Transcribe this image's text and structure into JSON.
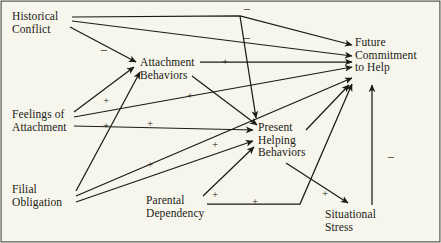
{
  "figure": {
    "type": "path-diagram",
    "background_color": "#f7f6ec",
    "ink_color": "#1b1b17",
    "border_color": "#4a4a40",
    "width": 441,
    "height": 243
  },
  "nodes": [
    {
      "id": "historical-conflict",
      "lines": [
        "Historical",
        "Conflict"
      ],
      "x": 12,
      "y": 10
    },
    {
      "id": "feelings-attachment",
      "lines": [
        "Feelings of",
        "Attachment"
      ],
      "x": 12,
      "y": 108
    },
    {
      "id": "filial-obligation",
      "lines": [
        "Filial",
        "Obligation"
      ],
      "x": 12,
      "y": 183
    },
    {
      "id": "parental-dependency",
      "lines": [
        "Parental",
        "Dependency"
      ],
      "x": 146,
      "y": 194
    },
    {
      "id": "attachment-behaviors",
      "lines": [
        "Attachment",
        "Behaviors"
      ],
      "x": 140,
      "y": 56
    },
    {
      "id": "present-helping",
      "lines": [
        "Present",
        "Helping",
        "Behaviors"
      ],
      "x": 258,
      "y": 121
    },
    {
      "id": "situational-stress",
      "lines": [
        "Situational",
        "Stress"
      ],
      "x": 325,
      "y": 208
    },
    {
      "id": "future-commitment",
      "lines": [
        "Future",
        "Commitment",
        "to Help"
      ],
      "x": 355,
      "y": 36
    }
  ],
  "edges": [
    {
      "id": "hc-to-fc",
      "from": "historical-conflict",
      "to": "future-commitment",
      "sign": "−",
      "sign_x": 243,
      "sign_y": 4,
      "routing": "elbow"
    },
    {
      "id": "hc-to-ph",
      "from": "historical-conflict",
      "to": "present-helping",
      "sign": "−",
      "sign_x": 243,
      "sign_y": 33,
      "routing": "elbow"
    },
    {
      "id": "hc-to-ab",
      "from": "historical-conflict",
      "to": "attachment-behaviors",
      "sign": "−",
      "sign_x": 100,
      "sign_y": 45,
      "routing": "straight"
    },
    {
      "id": "fa-to-ab",
      "from": "feelings-attachment",
      "to": "attachment-behaviors",
      "sign": "+",
      "sign_x": 103,
      "sign_y": 95,
      "routing": "straight"
    },
    {
      "id": "fa-to-fc",
      "from": "feelings-attachment",
      "to": "future-commitment",
      "sign": "+",
      "sign_x": 187,
      "sign_y": 90,
      "routing": "straight"
    },
    {
      "id": "fa-to-ph",
      "from": "feelings-attachment",
      "to": "present-helping",
      "sign": "+",
      "sign_x": 147,
      "sign_y": 118,
      "routing": "straight"
    },
    {
      "id": "fo-to-ab",
      "from": "filial-obligation",
      "to": "attachment-behaviors",
      "sign": "+",
      "sign_x": 103,
      "sign_y": 120,
      "routing": "straight"
    },
    {
      "id": "fo-to-fc",
      "from": "filial-obligation",
      "to": "future-commitment",
      "sign": "+",
      "sign_x": 147,
      "sign_y": 159,
      "routing": "straight"
    },
    {
      "id": "fo-to-ph",
      "from": "filial-obligation",
      "to": "present-helping",
      "sign": "+",
      "sign_x": 212,
      "sign_y": 139,
      "routing": "straight"
    },
    {
      "id": "ab-to-fc",
      "from": "attachment-behaviors",
      "to": "future-commitment",
      "sign": "+",
      "sign_x": 222,
      "sign_y": 56,
      "routing": "straight"
    },
    {
      "id": "ab-to-ph",
      "from": "attachment-behaviors",
      "to": "present-helping",
      "sign": "",
      "sign_x": 0,
      "sign_y": 0,
      "routing": "straight"
    },
    {
      "id": "pd-to-ph",
      "from": "parental-dependency",
      "to": "present-helping",
      "sign": "+",
      "sign_x": 212,
      "sign_y": 189,
      "routing": "straight"
    },
    {
      "id": "pd-to-fc",
      "from": "parental-dependency",
      "to": "future-commitment",
      "sign": "+",
      "sign_x": 252,
      "sign_y": 196,
      "routing": "elbow"
    },
    {
      "id": "ph-to-ss",
      "from": "present-helping",
      "to": "situational-stress",
      "sign": "+",
      "sign_x": 322,
      "sign_y": 188,
      "routing": "straight"
    },
    {
      "id": "ph-to-fc",
      "from": "present-helping",
      "to": "future-commitment",
      "sign": "",
      "sign_x": 0,
      "sign_y": 0,
      "routing": "straight"
    },
    {
      "id": "ss-to-fc",
      "from": "situational-stress",
      "to": "future-commitment",
      "sign": "−",
      "sign_x": 387,
      "sign_y": 152,
      "routing": "vertical"
    }
  ]
}
